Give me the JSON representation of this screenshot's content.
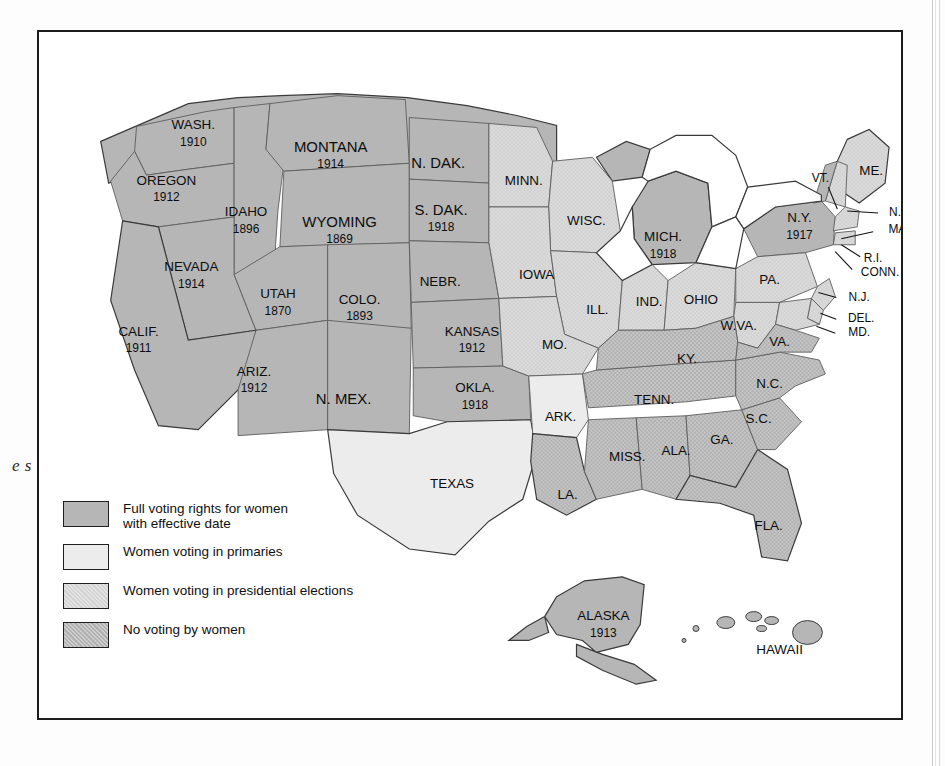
{
  "edge_caption_fragment": "e\ns",
  "legend": {
    "items": [
      {
        "id": "full",
        "label": "Full voting rights for women\nwith effective date",
        "fill": "#b6b6b6"
      },
      {
        "id": "primaries",
        "label": "Women voting in primaries",
        "fill": "#ececec"
      },
      {
        "id": "presidential",
        "label": "Women voting in presidential elections",
        "fill": "#dcdcdc"
      },
      {
        "id": "none",
        "label": "No voting by women",
        "fill": "#c6c6c6"
      }
    ]
  },
  "map": {
    "title": "Woman Suffrage Before the Nineteenth Amendment",
    "categories": [
      "full",
      "primaries",
      "presidential",
      "none"
    ],
    "states": [
      {
        "code": "WASH",
        "name": "WASH.",
        "date": "1910",
        "category": "full",
        "x": 155,
        "y": 102
      },
      {
        "code": "OREG",
        "name": "OREGON",
        "date": "1912",
        "category": "full",
        "x": 128,
        "y": 158
      },
      {
        "code": "IDAH",
        "name": "IDAHO",
        "date": "1896",
        "category": "full",
        "x": 208,
        "y": 190
      },
      {
        "code": "MONT",
        "name": "MONTANA",
        "date": "1914",
        "category": "full",
        "x": 293,
        "y": 125
      },
      {
        "code": "WYOM",
        "name": "WYOMING",
        "date": "1869",
        "category": "full",
        "x": 302,
        "y": 200
      },
      {
        "code": "NEVA",
        "name": "NEVADA",
        "date": "1914",
        "category": "full",
        "x": 153,
        "y": 245
      },
      {
        "code": "UTAH",
        "name": "UTAH",
        "date": "1870",
        "category": "full",
        "x": 240,
        "y": 272
      },
      {
        "code": "COLO",
        "name": "COLO.",
        "date": "1893",
        "category": "full",
        "x": 322,
        "y": 278
      },
      {
        "code": "CALI",
        "name": "CALIF.",
        "date": "1911",
        "category": "full",
        "x": 100,
        "y": 310
      },
      {
        "code": "ARIZ",
        "name": "ARIZ.",
        "date": "1912",
        "category": "full",
        "x": 216,
        "y": 350
      },
      {
        "code": "NMEX",
        "name": "N. MEX.",
        "date": "",
        "category": "full",
        "x": 306,
        "y": 370
      },
      {
        "code": "NDAK",
        "name": "N. DAK.",
        "date": "",
        "category": "full",
        "x": 401,
        "y": 133
      },
      {
        "code": "SDAK",
        "name": "S. DAK.",
        "date": "1918",
        "category": "full",
        "x": 404,
        "y": 188
      },
      {
        "code": "NEBR",
        "name": "NEBR.",
        "date": "",
        "category": "full",
        "x": 403,
        "y": 252
      },
      {
        "code": "KANS",
        "name": "KANSAS",
        "date": "1912",
        "category": "full",
        "x": 435,
        "y": 310
      },
      {
        "code": "OKLA",
        "name": "OKLA.",
        "date": "1918",
        "category": "full",
        "x": 438,
        "y": 367
      },
      {
        "code": "MINN",
        "name": "MINN.",
        "date": "",
        "category": "presidential",
        "x": 487,
        "y": 150
      },
      {
        "code": "WISC",
        "name": "WISC.",
        "date": "",
        "category": "presidential",
        "x": 550,
        "y": 191
      },
      {
        "code": "IOWA",
        "name": "IOWA",
        "date": "",
        "category": "presidential",
        "x": 500,
        "y": 245
      },
      {
        "code": "ILL",
        "name": "ILL.",
        "date": "",
        "category": "presidential",
        "x": 561,
        "y": 280
      },
      {
        "code": "MICH",
        "name": "MICH.",
        "date": "1918",
        "category": "full",
        "x": 627,
        "y": 215
      },
      {
        "code": "IND",
        "name": "IND.",
        "date": "",
        "category": "presidential",
        "x": 613,
        "y": 272
      },
      {
        "code": "OHIO",
        "name": "OHIO",
        "date": "",
        "category": "presidential",
        "x": 665,
        "y": 270
      },
      {
        "code": "MO",
        "name": "MO.",
        "date": "",
        "category": "presidential",
        "x": 518,
        "y": 315
      },
      {
        "code": "ARK",
        "name": "ARK.",
        "date": "",
        "category": "primaries",
        "x": 524,
        "y": 388
      },
      {
        "code": "TEXA",
        "name": "TEXAS",
        "date": "",
        "category": "primaries",
        "x": 415,
        "y": 455
      },
      {
        "code": "LA",
        "name": "LA.",
        "date": "",
        "category": "none",
        "x": 531,
        "y": 466
      },
      {
        "code": "MISS",
        "name": "MISS.",
        "date": "",
        "category": "none",
        "x": 591,
        "y": 428
      },
      {
        "code": "ALA",
        "name": "ALA.",
        "date": "",
        "category": "none",
        "x": 640,
        "y": 422
      },
      {
        "code": "GA",
        "name": "GA.",
        "date": "",
        "category": "none",
        "x": 686,
        "y": 411
      },
      {
        "code": "FLA",
        "name": "FLA.",
        "date": "",
        "category": "none",
        "x": 733,
        "y": 497
      },
      {
        "code": "TENN",
        "name": "TENN.",
        "date": "",
        "category": "none",
        "x": 618,
        "y": 371
      },
      {
        "code": "KY",
        "name": "KY.",
        "date": "",
        "category": "none",
        "x": 651,
        "y": 329
      },
      {
        "code": "SC",
        "name": "S.C.",
        "date": "",
        "category": "none",
        "x": 723,
        "y": 390
      },
      {
        "code": "NC",
        "name": "N.C.",
        "date": "",
        "category": "none",
        "x": 734,
        "y": 355
      },
      {
        "code": "VA",
        "name": "VA.",
        "date": "",
        "category": "none",
        "x": 744,
        "y": 312
      },
      {
        "code": "WVA",
        "name": "W.VA.",
        "date": "",
        "category": "presidential",
        "x": 703,
        "y": 296
      },
      {
        "code": "PA",
        "name": "PA.",
        "date": "",
        "category": "presidential",
        "x": 734,
        "y": 250
      },
      {
        "code": "NY",
        "name": "N.Y.",
        "date": "1917",
        "category": "full",
        "x": 764,
        "y": 196
      },
      {
        "code": "ME",
        "name": "ME.",
        "date": "",
        "category": "presidential",
        "x": 836,
        "y": 140
      }
    ],
    "callouts": [
      {
        "code": "VT",
        "name": "VT.",
        "x": 785,
        "y": 148,
        "lx1": 793,
        "ly1": 156,
        "lx2": 802,
        "ly2": 178
      },
      {
        "code": "NH",
        "name": "N.H.",
        "x": 866,
        "y": 182,
        "lx1": 843,
        "ly1": 182,
        "lx2": 812,
        "ly2": 180
      },
      {
        "code": "MASS",
        "name": "MASS.",
        "x": 872,
        "y": 199,
        "lx1": 838,
        "ly1": 201,
        "lx2": 806,
        "ly2": 208
      },
      {
        "code": "RI",
        "name": "R.I.",
        "x": 838,
        "y": 228,
        "lx1": 825,
        "ly1": 226,
        "lx2": 806,
        "ly2": 214
      },
      {
        "code": "CONN",
        "name": "CONN.",
        "x": 845,
        "y": 242,
        "lx1": 817,
        "ly1": 239,
        "lx2": 800,
        "ly2": 221
      },
      {
        "code": "NJ",
        "name": "N.J.",
        "x": 824,
        "y": 267,
        "lx1": 801,
        "ly1": 267,
        "lx2": 783,
        "ly2": 262
      },
      {
        "code": "DEL",
        "name": "DEL.",
        "x": 826,
        "y": 289,
        "lx1": 801,
        "ly1": 289,
        "lx2": 785,
        "ly2": 283
      },
      {
        "code": "MD",
        "name": "MD.",
        "x": 824,
        "y": 303,
        "lx1": 800,
        "ly1": 303,
        "lx2": 781,
        "ly2": 296
      }
    ],
    "insets": [
      {
        "code": "ALASKA",
        "name": "ALASKA",
        "date": "1913",
        "category": "full",
        "x": 567,
        "y": 596
      },
      {
        "code": "HAWAII",
        "name": "HAWAII",
        "date": "",
        "category": "full",
        "x": 744,
        "y": 622
      }
    ]
  }
}
